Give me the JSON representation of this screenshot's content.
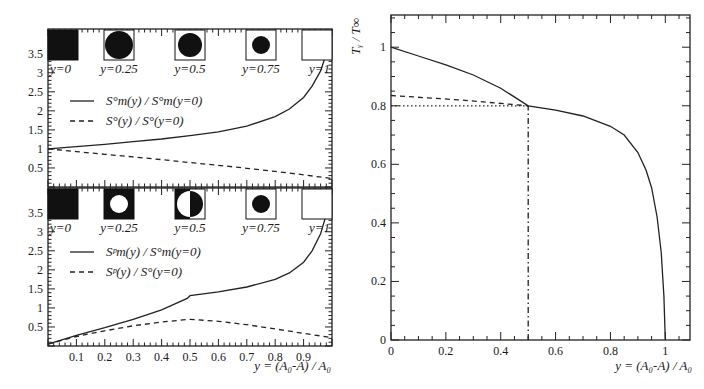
{
  "chart_data": [
    {
      "id": "top-left",
      "type": "line",
      "title": "",
      "xlabel": "",
      "ylabel": "",
      "xlim": [
        0,
        1
      ],
      "ylim": [
        0,
        4.15
      ],
      "yticks": [
        "0.5",
        "1",
        "1.5",
        "2",
        "2.5",
        "3",
        "3.5"
      ],
      "ytick_values": [
        0.5,
        1,
        1.5,
        2,
        2.5,
        3,
        3.5
      ],
      "xticks": [],
      "legend": [
        {
          "label": "S°m(y) / S°m(y=0)",
          "style": "solid"
        },
        {
          "label": "S°(y) / S°(y=0)",
          "style": "dashed"
        }
      ],
      "insets": [
        {
          "label": "y=0",
          "shape": "filled-square"
        },
        {
          "label": "y=0.25",
          "shape": "square-with-filled-circle-large"
        },
        {
          "label": "y=0.5",
          "shape": "square-with-filled-circle-medium"
        },
        {
          "label": "y=0.75",
          "shape": "square-with-filled-circle-small"
        },
        {
          "label": "y=1",
          "shape": "empty-square"
        }
      ],
      "series": [
        {
          "name": "S°m(y) / S°m(y=0)",
          "style": "solid",
          "x": [
            0,
            0.1,
            0.2,
            0.3,
            0.4,
            0.5,
            0.6,
            0.7,
            0.8,
            0.85,
            0.9,
            0.93,
            0.96,
            0.98,
            1.0
          ],
          "y": [
            1.0,
            1.06,
            1.12,
            1.19,
            1.26,
            1.35,
            1.45,
            1.6,
            1.85,
            2.05,
            2.35,
            2.65,
            3.05,
            3.5,
            4.15
          ]
        },
        {
          "name": "S°(y) / S°(y=0)",
          "style": "dashed",
          "x": [
            0,
            0.1,
            0.2,
            0.3,
            0.4,
            0.5,
            0.6,
            0.7,
            0.8,
            0.9,
            1.0
          ],
          "y": [
            1.0,
            0.93,
            0.86,
            0.79,
            0.72,
            0.64,
            0.57,
            0.49,
            0.41,
            0.32,
            0.22
          ]
        }
      ]
    },
    {
      "id": "bottom-left",
      "type": "line",
      "title": "",
      "xlabel": "y = (A0-A) / A0",
      "ylabel": "",
      "xlim": [
        0,
        1
      ],
      "ylim": [
        0,
        4.15
      ],
      "yticks": [
        "0.5",
        "1",
        "1.5",
        "2",
        "2.5",
        "3",
        "3.5"
      ],
      "ytick_values": [
        0.5,
        1,
        1.5,
        2,
        2.5,
        3,
        3.5
      ],
      "xticks": [
        "0.1",
        "0.2",
        "0.3",
        "0.4",
        "0.5",
        "0.6",
        "0.7",
        "0.8",
        "0.9"
      ],
      "xtick_values": [
        0.1,
        0.2,
        0.3,
        0.4,
        0.5,
        0.6,
        0.7,
        0.8,
        0.9
      ],
      "legend": [
        {
          "label": "Sᵖm(y) / S°m(y=0)",
          "style": "solid"
        },
        {
          "label": "Sᵖ(y) / S°(y=0)",
          "style": "dashed"
        }
      ],
      "insets": [
        {
          "label": "y=0",
          "shape": "filled-square"
        },
        {
          "label": "y=0.25",
          "shape": "filled-square-with-white-circle"
        },
        {
          "label": "y=0.5",
          "shape": "half-split"
        },
        {
          "label": "y=0.75",
          "shape": "square-with-filled-circle-small"
        },
        {
          "label": "y=1",
          "shape": "empty-square"
        }
      ],
      "series": [
        {
          "name": "Sᵖm(y) / S°m(y=0)",
          "style": "solid",
          "x": [
            0,
            0.1,
            0.2,
            0.3,
            0.4,
            0.49,
            0.5,
            0.6,
            0.7,
            0.8,
            0.85,
            0.9,
            0.93,
            0.96,
            0.98,
            1.0
          ],
          "y": [
            0.05,
            0.28,
            0.48,
            0.7,
            0.95,
            1.25,
            1.32,
            1.42,
            1.55,
            1.75,
            1.92,
            2.2,
            2.5,
            2.95,
            3.45,
            4.15
          ]
        },
        {
          "name": "Sᵖ(y) / S°(y=0)",
          "style": "dashed",
          "x": [
            0,
            0.1,
            0.2,
            0.3,
            0.4,
            0.5,
            0.6,
            0.7,
            0.8,
            0.9,
            1.0
          ],
          "y": [
            0.05,
            0.25,
            0.4,
            0.53,
            0.63,
            0.7,
            0.65,
            0.56,
            0.45,
            0.33,
            0.22
          ]
        }
      ]
    },
    {
      "id": "right",
      "type": "line",
      "title": "",
      "xlabel": "y = (A0-A) / A0",
      "ylabel": "Ty / T∞",
      "xlim": [
        0,
        1.09
      ],
      "ylim": [
        0,
        1.11
      ],
      "xticks": [
        "0",
        "0.2",
        "0.4",
        "0.6",
        "0.8",
        "1"
      ],
      "xtick_values": [
        0,
        0.2,
        0.4,
        0.6,
        0.8,
        1
      ],
      "yticks": [
        "0",
        "0.2",
        "0.4",
        "0.6",
        "0.8",
        "1"
      ],
      "ytick_values": [
        0,
        0.2,
        0.4,
        0.6,
        0.8,
        1
      ],
      "series": [
        {
          "name": "Ty/T∞",
          "style": "solid",
          "x": [
            0,
            0.1,
            0.2,
            0.3,
            0.4,
            0.5,
            0.6,
            0.7,
            0.8,
            0.85,
            0.9,
            0.93,
            0.95,
            0.97,
            0.985,
            0.995,
            1.0
          ],
          "y": [
            1.0,
            0.97,
            0.94,
            0.905,
            0.86,
            0.8,
            0.785,
            0.765,
            0.73,
            0.7,
            0.64,
            0.58,
            0.52,
            0.42,
            0.3,
            0.15,
            0.0
          ]
        },
        {
          "name": "extrapolation",
          "style": "dashed",
          "x": [
            0,
            0.25,
            0.5
          ],
          "y": [
            0.835,
            0.82,
            0.8
          ]
        },
        {
          "name": "reference-0.8",
          "style": "dotted",
          "x": [
            0,
            0.5
          ],
          "y": [
            0.8,
            0.8
          ]
        },
        {
          "name": "reference-y0.5",
          "style": "dashdot",
          "x": [
            0.5,
            0.5
          ],
          "y": [
            0,
            0.8
          ]
        }
      ]
    }
  ],
  "labels": {
    "bottom_left_xlabel": "y = (A₀-A) / A₀",
    "right_xlabel": "y = (A₀-A) / A₀",
    "right_ylabel": "Tᵧ / T∞"
  }
}
